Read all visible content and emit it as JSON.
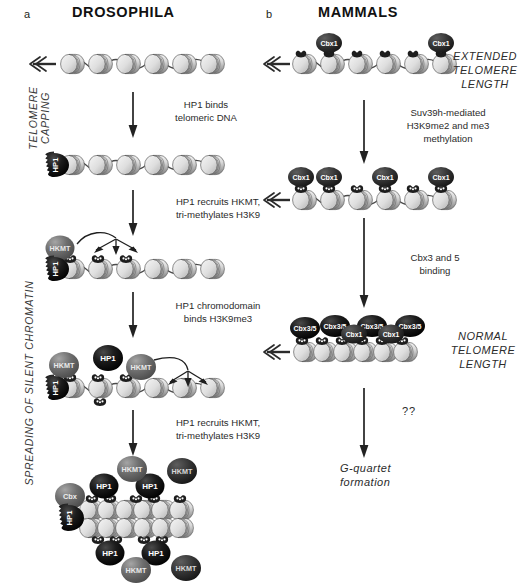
{
  "figure": {
    "panels": [
      {
        "letter": "a",
        "title": "DROSOPHILA"
      },
      {
        "letter": "b",
        "title": "MAMMALS"
      }
    ],
    "side_labels": [
      {
        "id": "telomere-capping",
        "line1": "TELOMERE",
        "line2": "CAPPING"
      },
      {
        "id": "spreading",
        "line1": "SPREADING OF SILENT CHROMATIN",
        "line2": ""
      }
    ]
  },
  "left_column": {
    "steps": [
      {
        "id": "step-1-2",
        "caption_line1": "HP1 binds",
        "caption_line2": "telomeric DNA"
      },
      {
        "id": "step-2-3",
        "caption_line1": "HP1 recruits HKMT,",
        "caption_line2": "tri-methylates H3K9"
      },
      {
        "id": "step-3-4",
        "caption_line1": "HP1 chromodomain",
        "caption_line2": "binds H3K9me3"
      },
      {
        "id": "step-4-5",
        "caption_line1": "HP1 recruits HKMT,",
        "caption_line2": "tri-methylates H3K9"
      }
    ],
    "protein_labels": {
      "hp1": "HP1",
      "hkmt": "HKMT"
    }
  },
  "right_column": {
    "steps": [
      {
        "id": "m-step-1-2",
        "caption_line1": "Suv39h-mediated",
        "caption_line2": "H3K9me2 and me3",
        "caption_line3": "methylation"
      },
      {
        "id": "m-step-2-3",
        "caption_line1": "Cbx3 and 5",
        "caption_line2": "binding",
        "caption_line3": ""
      },
      {
        "id": "m-step-3-4",
        "caption_line1": "??",
        "caption_line2": "",
        "caption_line3": ""
      }
    ],
    "annotations": [
      {
        "id": "extended-telomere-length",
        "line1": "EXTENDED",
        "line2": "TELOMERE",
        "line3": "LENGTH"
      },
      {
        "id": "normal-telomere-length",
        "line1": "NORMAL",
        "line2": "TELOMERE",
        "line3": "LENGTH"
      },
      {
        "id": "g-quartet",
        "line1": "G-quartet",
        "line2": "formation",
        "line3": ""
      }
    ],
    "protein_labels": {
      "cbx1": "Cbx1",
      "cbx35": "Cbx3/5"
    }
  },
  "colors": {
    "background": "#ffffff",
    "ink": "#231f20",
    "nucleosome_light": "#e3e3e3",
    "nucleosome_mid": "#b9b9b9",
    "nucleosome_dark": "#8d8d8d",
    "protein_black": "#111111",
    "protein_gray": "#6f6f6f",
    "protein_darkgray": "#555555",
    "tail_dark": "#2a2a2a",
    "dna_line": "#4a4a4a"
  }
}
